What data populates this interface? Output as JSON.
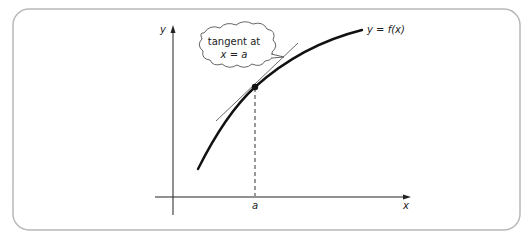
{
  "diagram": {
    "axes": {
      "x_label": "x",
      "y_label": "y"
    },
    "curve_label": "y = f(x)",
    "point_label": "a",
    "callout": {
      "line1": "tangent at",
      "line2": "x = a"
    },
    "colors": {
      "frame": "#b8b8b8",
      "ink": "#111111",
      "tangent": "#444444"
    }
  }
}
